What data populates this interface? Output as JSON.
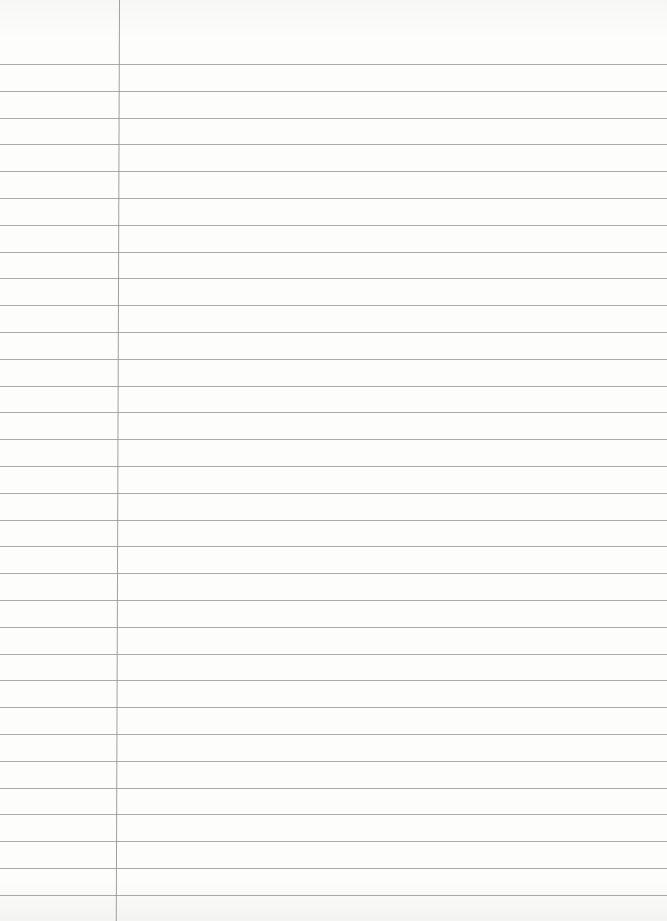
{
  "paper": {
    "type": "ruled-notebook-page",
    "line_count": 32,
    "first_line_y": 64,
    "line_spacing": 26.8,
    "margin_line_x": 119,
    "line_color": "#8e8e8e",
    "background_color": "#fbfbfa"
  }
}
